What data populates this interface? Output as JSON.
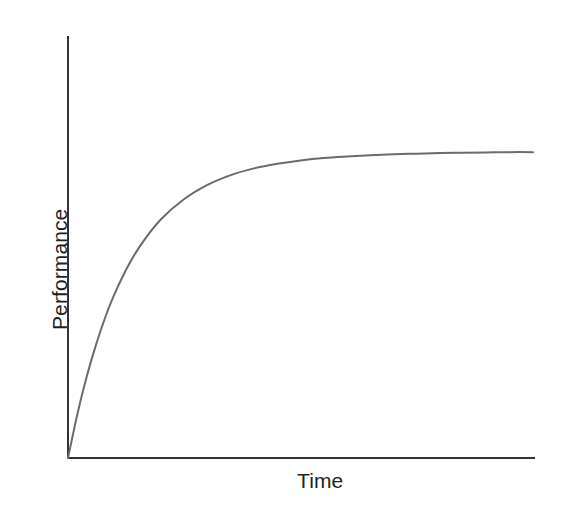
{
  "chart_data": {
    "type": "line",
    "title": "",
    "subtitle": "",
    "xlabel": "Time",
    "ylabel": "Performance",
    "legend": [],
    "legend_position": "none",
    "grid": false,
    "ticks": {
      "x": [],
      "y": []
    },
    "xlim": [
      0,
      100
    ],
    "ylim": [
      0,
      100
    ],
    "annotations": [],
    "series": [
      {
        "name": "Performance over time",
        "color": "#6b6b6b",
        "line_width": 2,
        "x": [
          0,
          2,
          4,
          6,
          8,
          10,
          13,
          16,
          20,
          25,
          30,
          35,
          40,
          45,
          50,
          55,
          60,
          65,
          70,
          75,
          80,
          85,
          90,
          95,
          100
        ],
        "y": [
          0,
          14.2,
          26.4,
          36.8,
          45.8,
          53.4,
          62.8,
          70.2,
          77.8,
          84.4,
          89.0,
          92.2,
          94.4,
          95.9,
          97.0,
          97.8,
          98.3,
          98.7,
          99.0,
          99.2,
          99.4,
          99.5,
          99.6,
          99.7,
          99.7
        ]
      }
    ],
    "asymptote": 100,
    "curve_model": "y = A * (1 - exp(-t / tau))"
  },
  "axes": {
    "x_axis_color": "#333333",
    "y_axis_color": "#333333",
    "axis_width": 2,
    "origin_label": ""
  },
  "style": {
    "background": "#ffffff",
    "curve_color": "#6b6b6b",
    "text_color": "#231f20"
  }
}
